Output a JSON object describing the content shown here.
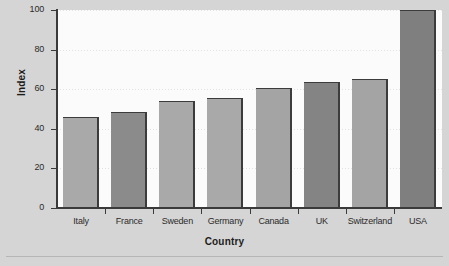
{
  "chart_data": {
    "type": "bar",
    "title": "",
    "xlabel": "Country",
    "ylabel": "Index",
    "categories": [
      "Italy",
      "France",
      "Sweden",
      "Germany",
      "Canada",
      "UK",
      "Switzerland",
      "USA"
    ],
    "values": [
      46,
      48.5,
      54,
      55.5,
      60.5,
      63.5,
      65,
      100
    ],
    "ylim": [
      0,
      100
    ],
    "yticks": [
      0,
      20,
      40,
      60,
      80,
      100
    ],
    "ytick_labels": [
      "0",
      "20",
      "40",
      "60",
      "80",
      "100"
    ],
    "grid": "horizontal-dotted-light",
    "legend": "none",
    "bar_colors": [
      "#a9a9a9",
      "#8b8b8b",
      "#a9a9a9",
      "#a9a9a9",
      "#a4a4a4",
      "#848484",
      "#a4a4a4",
      "#7f7f7f"
    ],
    "bar_edge_color": "#3c3c3c",
    "plot_background": "#fbfbfb",
    "figure_background": "#d5d5d5"
  }
}
